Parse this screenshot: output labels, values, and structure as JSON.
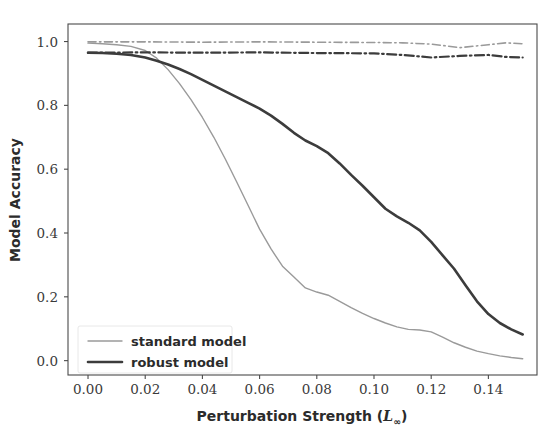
{
  "chart_data": {
    "type": "line",
    "title": "",
    "xlabel": "Perturbation Strength (L∞)",
    "xlabel_main": "Perturbation Strength (",
    "xlabel_sym": "L",
    "xlabel_sub": "∞",
    "xlabel_close": ")",
    "ylabel": "Model Accuracy",
    "xlim": [
      -0.007,
      0.157
    ],
    "ylim": [
      -0.045,
      1.055
    ],
    "grid": false,
    "legend_position": "lower left",
    "xticks": [
      0.0,
      0.02,
      0.04,
      0.06,
      0.08,
      0.1,
      0.12,
      0.14
    ],
    "xticklabels": [
      "0.00",
      "0.02",
      "0.04",
      "0.06",
      "0.08",
      "0.10",
      "0.12",
      "0.14"
    ],
    "yticks": [
      0.0,
      0.2,
      0.4,
      0.6,
      0.8,
      1.0
    ],
    "yticklabels": [
      "0.0",
      "0.2",
      "0.4",
      "0.6",
      "0.8",
      "1.0"
    ],
    "series": [
      {
        "name": "standard model",
        "legend_label": "standard model",
        "color": "#9a9a9a",
        "linestyle": "solid",
        "linewidth": 1.4,
        "x": [
          0.0,
          0.005,
          0.01,
          0.015,
          0.02,
          0.024,
          0.028,
          0.032,
          0.036,
          0.04,
          0.044,
          0.048,
          0.052,
          0.056,
          0.06,
          0.064,
          0.068,
          0.072,
          0.076,
          0.08,
          0.084,
          0.088,
          0.092,
          0.096,
          0.1,
          0.104,
          0.108,
          0.112,
          0.116,
          0.12,
          0.124,
          0.128,
          0.132,
          0.136,
          0.14,
          0.144,
          0.148,
          0.152
        ],
        "y": [
          0.995,
          0.993,
          0.99,
          0.985,
          0.972,
          0.948,
          0.912,
          0.868,
          0.818,
          0.762,
          0.7,
          0.632,
          0.56,
          0.486,
          0.412,
          0.35,
          0.296,
          0.262,
          0.228,
          0.215,
          0.205,
          0.186,
          0.166,
          0.148,
          0.132,
          0.118,
          0.106,
          0.098,
          0.096,
          0.09,
          0.074,
          0.056,
          0.042,
          0.03,
          0.022,
          0.015,
          0.01,
          0.006
        ]
      },
      {
        "name": "robust model",
        "legend_label": "robust model",
        "color": "#3c3c3c",
        "linestyle": "solid",
        "linewidth": 2.6,
        "x": [
          0.0,
          0.005,
          0.01,
          0.015,
          0.02,
          0.024,
          0.028,
          0.032,
          0.036,
          0.04,
          0.044,
          0.048,
          0.052,
          0.056,
          0.06,
          0.064,
          0.068,
          0.072,
          0.076,
          0.08,
          0.084,
          0.088,
          0.092,
          0.096,
          0.1,
          0.104,
          0.108,
          0.112,
          0.116,
          0.12,
          0.124,
          0.128,
          0.132,
          0.136,
          0.14,
          0.144,
          0.148,
          0.152
        ],
        "y": [
          0.965,
          0.964,
          0.962,
          0.958,
          0.95,
          0.94,
          0.928,
          0.914,
          0.898,
          0.88,
          0.862,
          0.844,
          0.826,
          0.808,
          0.79,
          0.768,
          0.742,
          0.714,
          0.69,
          0.672,
          0.65,
          0.618,
          0.582,
          0.548,
          0.512,
          0.476,
          0.452,
          0.432,
          0.408,
          0.372,
          0.33,
          0.288,
          0.236,
          0.186,
          0.146,
          0.118,
          0.098,
          0.082
        ]
      },
      {
        "name": "standard model clean",
        "legend_label": "",
        "color": "#9a9a9a",
        "linestyle": "dashdot",
        "linewidth": 1.6,
        "x": [
          0.0,
          0.02,
          0.04,
          0.06,
          0.08,
          0.1,
          0.11,
          0.12,
          0.13,
          0.14,
          0.146,
          0.152
        ],
        "y": [
          0.999,
          0.999,
          0.998,
          0.999,
          0.998,
          0.997,
          0.996,
          0.992,
          0.981,
          0.99,
          0.996,
          0.993
        ]
      },
      {
        "name": "robust model clean",
        "legend_label": "",
        "color": "#3c3c3c",
        "linestyle": "dashdot",
        "linewidth": 2.2,
        "x": [
          0.0,
          0.02,
          0.04,
          0.06,
          0.08,
          0.1,
          0.11,
          0.12,
          0.13,
          0.14,
          0.146,
          0.152
        ],
        "y": [
          0.965,
          0.966,
          0.965,
          0.966,
          0.964,
          0.963,
          0.958,
          0.95,
          0.955,
          0.958,
          0.952,
          0.95
        ]
      }
    ]
  },
  "legend": {
    "entries": [
      {
        "label": "standard model",
        "color": "#9a9a9a",
        "width": 1.4
      },
      {
        "label": "robust model",
        "color": "#3c3c3c",
        "width": 2.6
      }
    ]
  },
  "colors": {
    "standard": "#9a9a9a",
    "robust": "#3c3c3c",
    "frame": "#4a4a4a",
    "text": "#2b2b2b",
    "background": "#ffffff"
  }
}
